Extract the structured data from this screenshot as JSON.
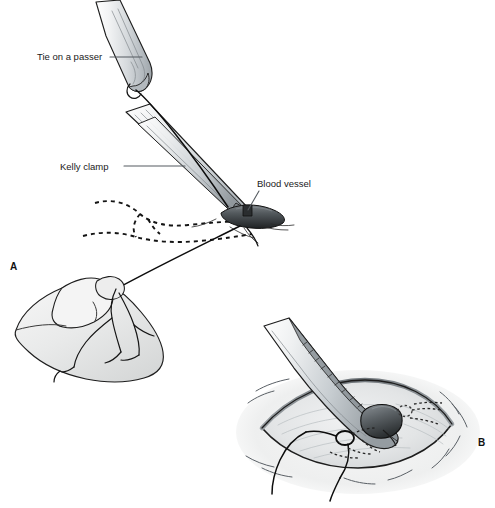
{
  "figure": {
    "background_color": "#ffffff",
    "width": 495,
    "height": 508
  },
  "panels": [
    {
      "id": "A",
      "letter": "A",
      "letter_x": 10,
      "letter_y": 270,
      "description": "Kelly clamp and tie on a passer with blood vessel, hand holding suture"
    },
    {
      "id": "B",
      "letter": "B",
      "letter_x": 478,
      "letter_y": 446,
      "description": "Clamp entering lens-shaped incision with vessel and knot"
    }
  ],
  "labels": [
    {
      "name": "tie-on-a-passer",
      "text": "Tie on a passer",
      "x": 37,
      "y": 60,
      "anchor": "start",
      "leader": "M110,57 L142,57"
    },
    {
      "name": "kelly-clamp",
      "text": "Kelly clamp",
      "x": 60,
      "y": 170,
      "anchor": "start",
      "leader": "M124,166 L185,166"
    },
    {
      "name": "blood-vessel",
      "text": "Blood vessel",
      "x": 257,
      "y": 187,
      "anchor": "start",
      "leader": "M259,191 L248,210"
    }
  ],
  "colors": {
    "outline": "#1d1d1d",
    "leader": "#555b60",
    "metal_light": "#f1f2f3",
    "metal_mid": "#c9ced2",
    "metal_dark": "#9aa1a7",
    "vessel_dark": "#4d5458",
    "vessel_darkest": "#26292b",
    "skin_fill": "#e9eaea",
    "tissue_fill": "#e4e6e7",
    "suture": "#0d0d0d",
    "text": "#1a1a1a"
  },
  "elements": {
    "passer": "vessel-loop-passer-instrument",
    "clamp": "kelly-clamp-instrument",
    "vessel": "blood-vessel",
    "hand": "hand-holding-suture",
    "incision": "lens-shaped-incision",
    "knot": "suture-knot",
    "hidden_anatomy": "dashed-hidden-outline"
  }
}
